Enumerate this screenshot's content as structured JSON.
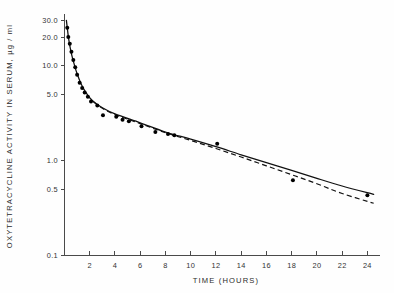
{
  "chart_data": {
    "type": "line",
    "title": "",
    "xlabel": "TIME (HOURS)",
    "ylabel": "OXYTETRACYCLINE ACTIVITY IN SERUM,  µg / ml",
    "yscale": "log",
    "xscale": "linear",
    "xlim": [
      0,
      25
    ],
    "ylim": [
      0.1,
      35
    ],
    "grid": false,
    "legend": "none",
    "xticks": [
      2,
      4,
      6,
      8,
      10,
      12,
      14,
      16,
      18,
      20,
      22,
      24
    ],
    "xticklabels": [
      "2",
      "4",
      "6",
      "8",
      "10",
      "12",
      "14",
      "16",
      "18",
      "20",
      "22",
      "24"
    ],
    "yticks": [
      0.1,
      0.5,
      1.0,
      5.0,
      10.0,
      20.0,
      30.0
    ],
    "yticklabels": [
      "0.1",
      "0.5",
      "1.0",
      "5.0",
      "10.0",
      "20.0",
      "30.0"
    ],
    "series": [
      {
        "name": "observed serum activity",
        "type": "scatter",
        "marker": "filled-circle",
        "points": [
          {
            "x": 0.22,
            "y": 25.0
          },
          {
            "x": 0.3,
            "y": 20.0
          },
          {
            "x": 0.42,
            "y": 17.0
          },
          {
            "x": 0.55,
            "y": 14.0
          },
          {
            "x": 0.7,
            "y": 11.5
          },
          {
            "x": 0.85,
            "y": 9.6
          },
          {
            "x": 1.0,
            "y": 8.0
          },
          {
            "x": 1.2,
            "y": 6.6
          },
          {
            "x": 1.4,
            "y": 5.8
          },
          {
            "x": 1.6,
            "y": 5.2
          },
          {
            "x": 1.85,
            "y": 4.7
          },
          {
            "x": 2.1,
            "y": 4.2
          },
          {
            "x": 2.6,
            "y": 3.8
          },
          {
            "x": 3.05,
            "y": 3.0
          },
          {
            "x": 4.1,
            "y": 2.9
          },
          {
            "x": 4.6,
            "y": 2.7
          },
          {
            "x": 5.1,
            "y": 2.6
          },
          {
            "x": 6.1,
            "y": 2.3
          },
          {
            "x": 7.2,
            "y": 2.0
          },
          {
            "x": 8.2,
            "y": 1.9
          },
          {
            "x": 8.7,
            "y": 1.85
          },
          {
            "x": 12.1,
            "y": 1.5
          },
          {
            "x": 18.1,
            "y": 0.62
          },
          {
            "x": 24.0,
            "y": 0.43
          }
        ]
      },
      {
        "name": "fitted curve (solid)",
        "type": "line",
        "style": "solid",
        "points": [
          {
            "x": 0.15,
            "y": 30.0
          },
          {
            "x": 0.22,
            "y": 25.0
          },
          {
            "x": 0.32,
            "y": 19.5
          },
          {
            "x": 0.45,
            "y": 15.5
          },
          {
            "x": 0.6,
            "y": 12.5
          },
          {
            "x": 0.8,
            "y": 10.0
          },
          {
            "x": 1.0,
            "y": 8.2
          },
          {
            "x": 1.3,
            "y": 6.5
          },
          {
            "x": 1.7,
            "y": 5.2
          },
          {
            "x": 2.2,
            "y": 4.3
          },
          {
            "x": 3.0,
            "y": 3.6
          },
          {
            "x": 4.0,
            "y": 3.1
          },
          {
            "x": 6.0,
            "y": 2.5
          },
          {
            "x": 8.0,
            "y": 2.0
          },
          {
            "x": 10.0,
            "y": 1.68
          },
          {
            "x": 12.0,
            "y": 1.4
          },
          {
            "x": 14.0,
            "y": 1.15
          },
          {
            "x": 16.0,
            "y": 0.95
          },
          {
            "x": 18.0,
            "y": 0.79
          },
          {
            "x": 20.0,
            "y": 0.65
          },
          {
            "x": 22.0,
            "y": 0.54
          },
          {
            "x": 24.5,
            "y": 0.44
          }
        ]
      },
      {
        "name": "fitted curve (dashed)",
        "type": "line",
        "style": "dashed",
        "points": [
          {
            "x": 2.3,
            "y": 4.15
          },
          {
            "x": 3.0,
            "y": 3.55
          },
          {
            "x": 4.0,
            "y": 3.05
          },
          {
            "x": 6.0,
            "y": 2.45
          },
          {
            "x": 8.0,
            "y": 1.97
          },
          {
            "x": 10.0,
            "y": 1.63
          },
          {
            "x": 12.0,
            "y": 1.34
          },
          {
            "x": 14.0,
            "y": 1.09
          },
          {
            "x": 16.0,
            "y": 0.88
          },
          {
            "x": 18.0,
            "y": 0.71
          },
          {
            "x": 20.0,
            "y": 0.57
          },
          {
            "x": 22.0,
            "y": 0.45
          },
          {
            "x": 24.5,
            "y": 0.355
          }
        ]
      }
    ]
  },
  "colors": {
    "ink": "#111111",
    "axis": "#4a4a4a",
    "background": "#ffffff"
  }
}
